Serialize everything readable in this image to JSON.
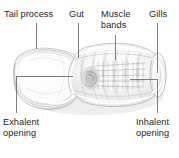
{
  "figure": {
    "background_color": "#ffffff",
    "text_color": "#262626",
    "leader_line_color": "#6e6e73",
    "body_fill": "#f2f2f2",
    "body_shadow": "#c9c9c9",
    "width": 179,
    "height": 158
  },
  "labels": {
    "tail_process": "Tail process",
    "gut": "Gut",
    "muscle_bands": "Muscle\nbands",
    "gills": "Gills",
    "exhalent_opening": "Exhalent\nopening",
    "inhalent_opening": "Inhalent\nopening"
  },
  "leaders": [
    {
      "name": "tail-process-leader",
      "type": "vertical",
      "x": 36,
      "y1": 23,
      "y2": 49
    },
    {
      "name": "gut-leader",
      "type": "vertical",
      "x": 78,
      "y1": 23,
      "y2": 58
    },
    {
      "name": "muscle-bands-leader",
      "type": "vertical",
      "x": 115,
      "y1": 35,
      "y2": 60
    },
    {
      "name": "gills-leader",
      "type": "vertical",
      "x": 157,
      "y1": 23,
      "y2": 73
    },
    {
      "name": "exhalent-opening-leader",
      "type": "elbow",
      "x1": 16,
      "y1": 113,
      "x2": 16,
      "y2": 76,
      "x3": 73,
      "y3": 76
    },
    {
      "name": "inhalent-opening-leader",
      "type": "elbow",
      "x1": 157,
      "y1": 113,
      "x2": 157,
      "y2": 79,
      "x3": 130,
      "y3": 79
    }
  ],
  "anatomy_features": [
    "tail-process",
    "gut",
    "muscle-bands",
    "gills",
    "exhalent-opening",
    "inhalent-opening",
    "translucent-body-tunic"
  ]
}
